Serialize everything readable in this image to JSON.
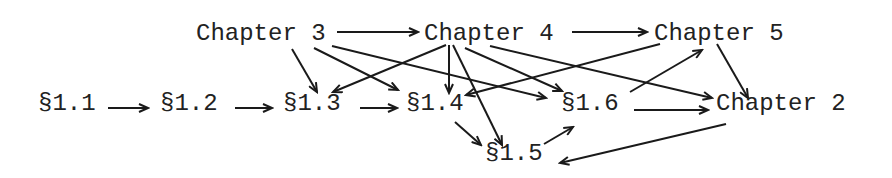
{
  "diagram": {
    "type": "directed-graph",
    "style": {
      "line_color": "#1a1a1a",
      "text_color": "#222222",
      "background": "#ffffff"
    },
    "nodes": [
      {
        "id": "ch3",
        "label": "Chapter 3",
        "x": 196,
        "y": 40
      },
      {
        "id": "ch4",
        "label": "Chapter 4",
        "x": 424,
        "y": 40
      },
      {
        "id": "ch5",
        "label": "Chapter 5",
        "x": 654,
        "y": 40
      },
      {
        "id": "s11",
        "label": "§1.1",
        "x": 38,
        "y": 110
      },
      {
        "id": "s12",
        "label": "§1.2",
        "x": 160,
        "y": 110
      },
      {
        "id": "s13",
        "label": "§1.3",
        "x": 283,
        "y": 110
      },
      {
        "id": "s14",
        "label": "§1.4",
        "x": 406,
        "y": 110
      },
      {
        "id": "s16",
        "label": "§1.6",
        "x": 561,
        "y": 110
      },
      {
        "id": "ch2",
        "label": "Chapter 2",
        "x": 716,
        "y": 110
      },
      {
        "id": "s15",
        "label": "§1.5",
        "x": 485,
        "y": 160
      }
    ],
    "edges": [
      {
        "from": "ch3",
        "to": "ch4",
        "x1": 337,
        "y1": 32,
        "x2": 418,
        "y2": 32
      },
      {
        "from": "ch4",
        "to": "ch5",
        "x1": 572,
        "y1": 32,
        "x2": 647,
        "y2": 32
      },
      {
        "from": "ch3",
        "to": "s13",
        "x1": 292,
        "y1": 49,
        "x2": 317,
        "y2": 92
      },
      {
        "from": "ch3",
        "to": "s14",
        "x1": 314,
        "y1": 48,
        "x2": 398,
        "y2": 90
      },
      {
        "from": "ch3",
        "to": "s16",
        "x1": 332,
        "y1": 46,
        "x2": 546,
        "y2": 98
      },
      {
        "from": "ch4",
        "to": "s13",
        "x1": 446,
        "y1": 45,
        "x2": 333,
        "y2": 92
      },
      {
        "from": "ch4",
        "to": "s14",
        "x1": 449,
        "y1": 45,
        "x2": 449,
        "y2": 93
      },
      {
        "from": "ch4",
        "to": "s15",
        "x1": 453,
        "y1": 45,
        "x2": 502,
        "y2": 145
      },
      {
        "from": "ch4",
        "to": "s16",
        "x1": 465,
        "y1": 48,
        "x2": 562,
        "y2": 91
      },
      {
        "from": "ch4",
        "to": "ch2",
        "x1": 490,
        "y1": 46,
        "x2": 712,
        "y2": 98
      },
      {
        "from": "ch5",
        "to": "s14",
        "x1": 660,
        "y1": 44,
        "x2": 466,
        "y2": 95
      },
      {
        "from": "ch5",
        "to": "ch2",
        "x1": 717,
        "y1": 44,
        "x2": 748,
        "y2": 98
      },
      {
        "from": "s16",
        "to": "ch5",
        "x1": 630,
        "y1": 92,
        "x2": 702,
        "y2": 50
      },
      {
        "from": "s11",
        "to": "s12",
        "x1": 108,
        "y1": 108,
        "x2": 148,
        "y2": 108
      },
      {
        "from": "s12",
        "to": "s13",
        "x1": 235,
        "y1": 108,
        "x2": 272,
        "y2": 108
      },
      {
        "from": "s13",
        "to": "s14",
        "x1": 360,
        "y1": 108,
        "x2": 397,
        "y2": 108
      },
      {
        "from": "s14",
        "to": "s15",
        "x1": 455,
        "y1": 122,
        "x2": 481,
        "y2": 145
      },
      {
        "from": "s15",
        "to": "s16",
        "x1": 544,
        "y1": 144,
        "x2": 573,
        "y2": 127
      },
      {
        "from": "s16",
        "to": "ch2",
        "x1": 634,
        "y1": 110,
        "x2": 708,
        "y2": 110
      },
      {
        "from": "ch2",
        "to": "s15",
        "x1": 726,
        "y1": 124,
        "x2": 560,
        "y2": 163
      }
    ]
  }
}
